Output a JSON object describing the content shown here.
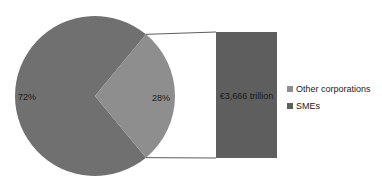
{
  "chart_data": {
    "type": "pie",
    "title": "",
    "slices": [
      {
        "name": "SMEs",
        "value": 72,
        "label": "72%",
        "color": "#707070"
      },
      {
        "name": "Other corporations",
        "value": 28,
        "label": "28%",
        "color": "#8e8e8e"
      }
    ],
    "breakout_bar": {
      "of_slice": "Other corporations",
      "label": "€3,666 trillion",
      "color": "#5e5e5e"
    },
    "legend": {
      "placement": "right",
      "entries": [
        {
          "name": "Other corporations",
          "color": "#8e8e8e"
        },
        {
          "name": "SMEs",
          "color": "#5e5e5e"
        }
      ]
    }
  }
}
